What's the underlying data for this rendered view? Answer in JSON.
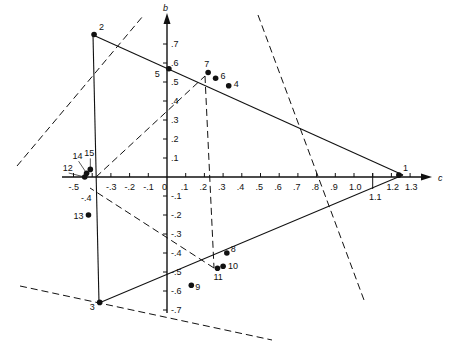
{
  "figure": {
    "axes": {
      "x_name": "c",
      "y_name": "b",
      "x_ticks": [
        {
          "label": "-.5",
          "value": -0.5
        },
        {
          "label": "-.4",
          "value": -0.4
        },
        {
          "label": "-.3",
          "value": -0.3
        },
        {
          "label": "-.2",
          "value": -0.2
        },
        {
          "label": "-.1",
          "value": -0.1
        },
        {
          "label": "0",
          "value": 0.0
        },
        {
          "label": ".1",
          "value": 0.1
        },
        {
          "label": ".2",
          "value": 0.2
        },
        {
          "label": ".3",
          "value": 0.3
        },
        {
          "label": ".4",
          "value": 0.4
        },
        {
          "label": ".5",
          "value": 0.5
        },
        {
          "label": ".6",
          "value": 0.6
        },
        {
          "label": ".7",
          "value": 0.7
        },
        {
          "label": ".8",
          "value": 0.8
        },
        {
          "label": ".9",
          "value": 0.9
        },
        {
          "label": "1.0",
          "value": 1.0
        },
        {
          "label": "1.1",
          "value": 1.1
        },
        {
          "label": "1.2",
          "value": 1.2
        },
        {
          "label": "1.3",
          "value": 1.3
        }
      ],
      "y_ticks": [
        {
          "label": ".7",
          "value": 0.7
        },
        {
          "label": ".6",
          "value": 0.6
        },
        {
          "label": ".5",
          "value": 0.5
        },
        {
          "label": ".4",
          "value": 0.4
        },
        {
          "label": ".3",
          "value": 0.3
        },
        {
          "label": ".2",
          "value": 0.2
        },
        {
          "label": ".1",
          "value": 0.1
        },
        {
          "label": "-.1",
          "value": -0.1
        },
        {
          "label": "-.2",
          "value": -0.2
        },
        {
          "label": "-.3",
          "value": -0.3
        },
        {
          "label": "-.4",
          "value": -0.4
        },
        {
          "label": "-.5",
          "value": -0.5
        },
        {
          "label": "-.6",
          "value": -0.6
        },
        {
          "label": "-.7",
          "value": -0.7
        }
      ]
    },
    "points": [
      {
        "id": "1",
        "c": 1.24,
        "b": 0.01
      },
      {
        "id": "2",
        "c": -0.39,
        "b": 0.75
      },
      {
        "id": "3",
        "c": -0.36,
        "b": -0.66
      },
      {
        "id": "4",
        "c": 0.33,
        "b": 0.48
      },
      {
        "id": "5",
        "c": 0.01,
        "b": 0.57
      },
      {
        "id": "6",
        "c": 0.26,
        "b": 0.52
      },
      {
        "id": "7",
        "c": 0.22,
        "b": 0.55
      },
      {
        "id": "8",
        "c": 0.32,
        "b": -0.4
      },
      {
        "id": "9",
        "c": 0.13,
        "b": -0.57
      },
      {
        "id": "10",
        "c": 0.3,
        "b": -0.47
      },
      {
        "id": "11",
        "c": 0.27,
        "b": -0.48
      },
      {
        "id": "12",
        "c": -0.44,
        "b": 0.0
      },
      {
        "id": "13",
        "c": -0.42,
        "b": -0.2
      },
      {
        "id": "14",
        "c": -0.43,
        "b": 0.02
      },
      {
        "id": "15",
        "c": -0.41,
        "b": 0.04
      }
    ],
    "annotations": {
      "neg_point_four_label": "-.4",
      "one_point_one_label": "1.1"
    },
    "colors": {
      "ink": "#111111",
      "background": "#ffffff"
    }
  },
  "chart_data": {
    "type": "scatter",
    "title": "",
    "xlabel": "c",
    "ylabel": "b",
    "xlim": [
      -0.55,
      1.38
    ],
    "ylim": [
      -0.75,
      0.8
    ],
    "grid": false,
    "series": [
      {
        "name": "points",
        "labels": [
          "1",
          "2",
          "3",
          "4",
          "5",
          "6",
          "7",
          "8",
          "9",
          "10",
          "11",
          "12",
          "13",
          "14",
          "15"
        ],
        "x": [
          1.24,
          -0.39,
          -0.36,
          0.33,
          0.01,
          0.26,
          0.22,
          0.32,
          0.13,
          0.3,
          0.27,
          -0.44,
          -0.42,
          -0.43,
          -0.41
        ],
        "y": [
          0.01,
          0.75,
          -0.66,
          0.48,
          0.57,
          0.52,
          0.55,
          -0.4,
          -0.57,
          -0.47,
          -0.48,
          0.0,
          -0.2,
          0.02,
          0.04
        ]
      }
    ],
    "lines": [
      {
        "style": "solid",
        "desc": "triangle 1-2-3",
        "vertices": [
          [
            1.24,
            0.01
          ],
          [
            -0.39,
            0.75
          ],
          [
            -0.36,
            -0.66
          ]
        ]
      },
      {
        "style": "dashed",
        "desc": "projection lines and bisectors"
      }
    ]
  }
}
